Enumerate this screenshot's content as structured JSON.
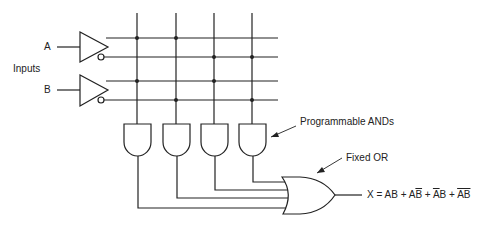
{
  "diagram": {
    "inputs_label": "Inputs",
    "input_a": "A",
    "input_b": "B",
    "and_label": "Programmable ANDs",
    "or_label": "Fixed OR",
    "output": {
      "prefix": "X = ",
      "terms": [
        {
          "text": "AB",
          "parts": [
            {
              "t": "A",
              "bar": false
            },
            {
              "t": "B",
              "bar": false
            }
          ]
        },
        {
          "text": "AB̄",
          "parts": [
            {
              "t": "A",
              "bar": false
            },
            {
              "t": "B",
              "bar": true
            }
          ]
        },
        {
          "text": "ĀB",
          "parts": [
            {
              "t": "A",
              "bar": true
            },
            {
              "t": "B",
              "bar": false
            }
          ]
        },
        {
          "text": "ĀB̄",
          "parts": [
            {
              "t": "AB",
              "bar": true
            }
          ]
        }
      ],
      "separator": " + ",
      "full_text": "X = AB + AB̄ + ĀB + ĀB̄"
    },
    "colors": {
      "line": "#222222",
      "background": "#ffffff"
    }
  }
}
